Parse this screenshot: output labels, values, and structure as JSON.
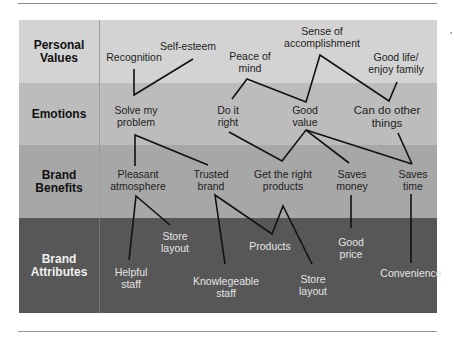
{
  "colors": {
    "row_personal_values": "#d3d3d3",
    "row_emotions": "#bcbcbc",
    "row_brand_benefits": "#a7a7a7",
    "row_brand_attributes": "#575757",
    "link_line": "#111111"
  },
  "rows": [
    {
      "label_line1": "Personal",
      "label_line2": "Values"
    },
    {
      "label_line1": "Emotions",
      "label_line2": ""
    },
    {
      "label_line1": "Brand",
      "label_line2": "Benefits"
    },
    {
      "label_line1": "Brand",
      "label_line2": "Attributes"
    }
  ],
  "nodes": {
    "personal_values": {
      "recognition": {
        "l1": "Recognition",
        "l2": ""
      },
      "self_esteem": {
        "l1": "Self-esteem",
        "l2": ""
      },
      "peace_of_mind": {
        "l1": "Peace of",
        "l2": "mind"
      },
      "sense_of_accomplishment": {
        "l1": "Sense of",
        "l2": "accomplishment"
      },
      "good_life": {
        "l1": "Good life/",
        "l2": "enjoy family"
      }
    },
    "emotions": {
      "solve_my_problem": {
        "l1": "Solve my",
        "l2": "problem"
      },
      "do_it_right": {
        "l1": "Do it",
        "l2": "right"
      },
      "good_value": {
        "l1": "Good",
        "l2": "value"
      },
      "can_do_other_things": {
        "l1": "Can do other",
        "l2": "things"
      }
    },
    "brand_benefits": {
      "pleasant_atmosphere": {
        "l1": "Pleasant",
        "l2": "atmosphere"
      },
      "trusted_brand": {
        "l1": "Trusted",
        "l2": "brand"
      },
      "get_the_right_products": {
        "l1": "Get the right",
        "l2": "products"
      },
      "saves_money": {
        "l1": "Saves",
        "l2": "money"
      },
      "saves_time": {
        "l1": "Saves",
        "l2": "time"
      }
    },
    "brand_attributes": {
      "store_layout_1": {
        "l1": "Store",
        "l2": "layout"
      },
      "helpful_staff": {
        "l1": "Helpful",
        "l2": "staff"
      },
      "products": {
        "l1": "Products",
        "l2": ""
      },
      "knowlegeable_staff": {
        "l1": "Knowlegeable",
        "l2": "staff"
      },
      "store_layout_2": {
        "l1": "Store",
        "l2": "layout"
      },
      "good_price": {
        "l1": "Good",
        "l2": "price"
      },
      "convenience": {
        "l1": "Convenience",
        "l2": ""
      }
    }
  },
  "links": [
    {
      "from": "Recognition",
      "to": "Solve my problem"
    },
    {
      "from": "Self-esteem",
      "to": "Solve my problem"
    },
    {
      "from": "Peace of mind",
      "to": "Do it right"
    },
    {
      "from": "Peace of mind",
      "to": "Good value"
    },
    {
      "from": "Sense of accomplishment",
      "to": "Good value"
    },
    {
      "from": "Sense of accomplishment",
      "to": "Can do other things"
    },
    {
      "from": "Good life/enjoy family",
      "to": "Can do other things"
    },
    {
      "from": "Solve my problem",
      "to": "Pleasant atmosphere"
    },
    {
      "from": "Solve my problem",
      "to": "Trusted brand"
    },
    {
      "from": "Do it right",
      "to": "Get the right products"
    },
    {
      "from": "Good value",
      "to": "Get the right products"
    },
    {
      "from": "Good value",
      "to": "Saves money"
    },
    {
      "from": "Good value",
      "to": "Saves time"
    },
    {
      "from": "Can do other things",
      "to": "Saves time"
    },
    {
      "from": "Pleasant atmosphere",
      "to": "Helpful staff"
    },
    {
      "from": "Pleasant atmosphere",
      "to": "Store layout"
    },
    {
      "from": "Trusted brand",
      "to": "Knowlegeable staff"
    },
    {
      "from": "Trusted brand",
      "to": "Products"
    },
    {
      "from": "Get the right products",
      "to": "Products"
    },
    {
      "from": "Get the right products",
      "to": "Store layout"
    },
    {
      "from": "Saves money",
      "to": "Good price"
    },
    {
      "from": "Saves time",
      "to": "Convenience"
    }
  ]
}
